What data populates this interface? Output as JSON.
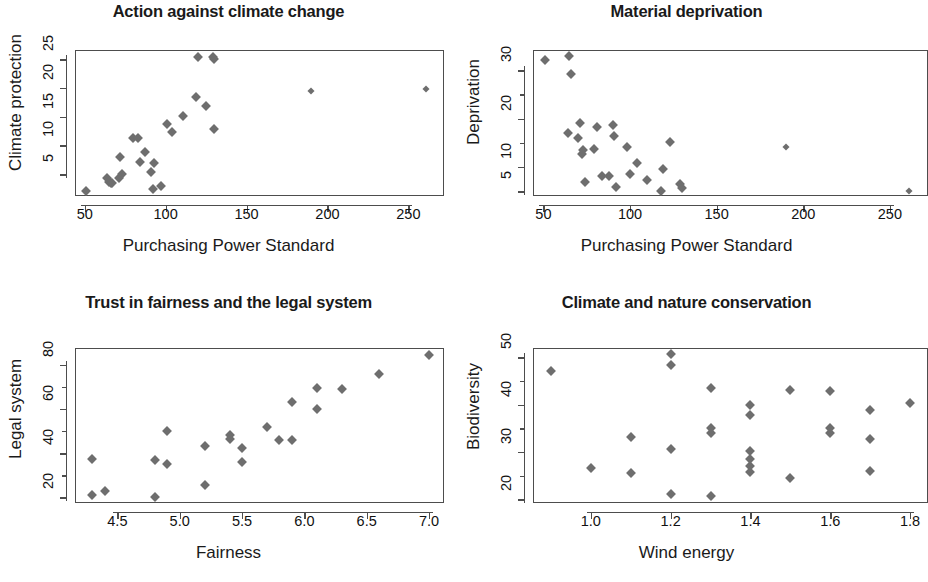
{
  "figure": {
    "layout": "2x2 grid of scatter plots",
    "background": "#ffffff",
    "marker_color": "#6e6e6e",
    "axis_color": "#4d4d4d"
  },
  "chart_data": [
    {
      "type": "scatter",
      "panel": "top-left",
      "title": "Action against climate change",
      "xlabel": "Purchasing Power Standard",
      "ylabel": "Climate protection",
      "xlim": [
        44,
        272
      ],
      "ylim": [
        1.2,
        26.6
      ],
      "xticks": [
        50,
        100,
        150,
        200,
        250
      ],
      "yticks": [
        5,
        10,
        15,
        20,
        25
      ],
      "grid": false,
      "legend": null,
      "points": [
        {
          "x": 51,
          "y": 2.1
        },
        {
          "x": 64,
          "y": 4.4
        },
        {
          "x": 65,
          "y": 3.6
        },
        {
          "x": 66,
          "y": 3.4
        },
        {
          "x": 67,
          "y": 3.5
        },
        {
          "x": 71,
          "y": 4.3
        },
        {
          "x": 72,
          "y": 7.9
        },
        {
          "x": 73,
          "y": 5.1
        },
        {
          "x": 80,
          "y": 11.3
        },
        {
          "x": 83,
          "y": 11.3
        },
        {
          "x": 84,
          "y": 7.1
        },
        {
          "x": 87,
          "y": 8.8
        },
        {
          "x": 91,
          "y": 5.4
        },
        {
          "x": 92,
          "y": 2.5
        },
        {
          "x": 93,
          "y": 7.0
        },
        {
          "x": 97,
          "y": 2.9
        },
        {
          "x": 101,
          "y": 13.7
        },
        {
          "x": 104,
          "y": 12.3
        },
        {
          "x": 111,
          "y": 15.1
        },
        {
          "x": 119,
          "y": 18.5
        },
        {
          "x": 120,
          "y": 25.4
        },
        {
          "x": 125,
          "y": 16.9
        },
        {
          "x": 129,
          "y": 25.3
        },
        {
          "x": 130,
          "y": 25.1
        },
        {
          "x": 130,
          "y": 12.8
        },
        {
          "x": 190,
          "y": 19.4
        },
        {
          "x": 261,
          "y": 19.8
        }
      ]
    },
    {
      "type": "scatter",
      "panel": "top-right",
      "title": "Material deprivation",
      "xlabel": "Purchasing Power Standard",
      "ylabel": "Deprivation",
      "xlim": [
        44,
        272
      ],
      "ylim": [
        4.0,
        34.2
      ],
      "xticks": [
        50,
        100,
        150,
        200,
        250
      ],
      "yticks": [
        5,
        10,
        20,
        30
      ],
      "yticks_minor": [
        15,
        25
      ],
      "grid": false,
      "legend": null,
      "points": [
        {
          "x": 51,
          "y": 32.2
        },
        {
          "x": 64,
          "y": 17.0
        },
        {
          "x": 65,
          "y": 33.0
        },
        {
          "x": 66,
          "y": 29.2
        },
        {
          "x": 70,
          "y": 16.0
        },
        {
          "x": 71,
          "y": 19.0
        },
        {
          "x": 72,
          "y": 12.6
        },
        {
          "x": 73,
          "y": 13.5
        },
        {
          "x": 74,
          "y": 6.8
        },
        {
          "x": 79,
          "y": 13.8
        },
        {
          "x": 81,
          "y": 18.2
        },
        {
          "x": 84,
          "y": 8.2
        },
        {
          "x": 88,
          "y": 8.2
        },
        {
          "x": 90,
          "y": 18.6
        },
        {
          "x": 91,
          "y": 16.4
        },
        {
          "x": 92,
          "y": 5.9
        },
        {
          "x": 98,
          "y": 14.1
        },
        {
          "x": 100,
          "y": 8.5
        },
        {
          "x": 104,
          "y": 10.8
        },
        {
          "x": 110,
          "y": 7.3
        },
        {
          "x": 118,
          "y": 5.0
        },
        {
          "x": 119,
          "y": 9.6
        },
        {
          "x": 123,
          "y": 15.2
        },
        {
          "x": 129,
          "y": 6.4
        },
        {
          "x": 130,
          "y": 5.6
        },
        {
          "x": 190,
          "y": 14.1
        },
        {
          "x": 261,
          "y": 5.1
        }
      ]
    },
    {
      "type": "scatter",
      "panel": "bottom-left",
      "title": "Trust in fairness and the legal system",
      "xlabel": "Fairness",
      "ylabel": "Legal system",
      "xlim": [
        4.16,
        7.12
      ],
      "ylim": [
        17.5,
        87.5
      ],
      "xticks": [
        4.5,
        5.0,
        5.5,
        6.0,
        6.5,
        7.0
      ],
      "xticklabels": [
        "4.5",
        "5.0",
        "5.5",
        "6.0",
        "6.5",
        "7.0"
      ],
      "yticks": [
        20,
        40,
        60,
        80
      ],
      "yticks_minor": [
        30,
        50,
        70
      ],
      "grid": false,
      "legend": null,
      "points": [
        {
          "x": 4.3,
          "y": 37.5
        },
        {
          "x": 4.3,
          "y": 21.2
        },
        {
          "x": 4.4,
          "y": 23.0
        },
        {
          "x": 4.8,
          "y": 37.0
        },
        {
          "x": 4.8,
          "y": 20.2
        },
        {
          "x": 4.9,
          "y": 50.0
        },
        {
          "x": 4.9,
          "y": 35.2
        },
        {
          "x": 5.2,
          "y": 43.1
        },
        {
          "x": 5.2,
          "y": 25.5
        },
        {
          "x": 5.4,
          "y": 48.0
        },
        {
          "x": 5.4,
          "y": 46.5
        },
        {
          "x": 5.5,
          "y": 42.3
        },
        {
          "x": 5.5,
          "y": 35.8
        },
        {
          "x": 5.7,
          "y": 51.8
        },
        {
          "x": 5.8,
          "y": 46.0
        },
        {
          "x": 5.9,
          "y": 63.3
        },
        {
          "x": 5.9,
          "y": 45.8
        },
        {
          "x": 6.1,
          "y": 69.6
        },
        {
          "x": 6.1,
          "y": 59.8
        },
        {
          "x": 6.3,
          "y": 69.0
        },
        {
          "x": 6.6,
          "y": 75.8
        },
        {
          "x": 7.0,
          "y": 84.3
        }
      ]
    },
    {
      "type": "scatter",
      "panel": "bottom-right",
      "title": "Climate and nature conservation",
      "xlabel": "Wind energy",
      "ylabel": "Biodiversity",
      "xlim": [
        0.855,
        1.845
      ],
      "ylim": [
        19.2,
        52.0
      ],
      "xticks": [
        1.0,
        1.2,
        1.4,
        1.6,
        1.8
      ],
      "xticklabels": [
        "1.0",
        "1.2",
        "1.4",
        "1.6",
        "1.8"
      ],
      "yticks": [
        20,
        30,
        40,
        50
      ],
      "yticks_minor": [
        25,
        35,
        45
      ],
      "grid": false,
      "legend": null,
      "points": [
        {
          "x": 0.9,
          "y": 47.2
        },
        {
          "x": 1.0,
          "y": 26.6
        },
        {
          "x": 1.1,
          "y": 33.2
        },
        {
          "x": 1.1,
          "y": 25.5
        },
        {
          "x": 1.2,
          "y": 50.8
        },
        {
          "x": 1.2,
          "y": 48.3
        },
        {
          "x": 1.2,
          "y": 30.6
        },
        {
          "x": 1.2,
          "y": 21.2
        },
        {
          "x": 1.3,
          "y": 43.5
        },
        {
          "x": 1.3,
          "y": 35.0
        },
        {
          "x": 1.3,
          "y": 34.0
        },
        {
          "x": 1.3,
          "y": 20.7
        },
        {
          "x": 1.4,
          "y": 40.0
        },
        {
          "x": 1.4,
          "y": 37.9
        },
        {
          "x": 1.4,
          "y": 30.2
        },
        {
          "x": 1.4,
          "y": 28.5
        },
        {
          "x": 1.4,
          "y": 27.0
        },
        {
          "x": 1.4,
          "y": 25.8
        },
        {
          "x": 1.5,
          "y": 43.2
        },
        {
          "x": 1.5,
          "y": 24.5
        },
        {
          "x": 1.6,
          "y": 43.0
        },
        {
          "x": 1.6,
          "y": 35.0
        },
        {
          "x": 1.6,
          "y": 34.0
        },
        {
          "x": 1.7,
          "y": 38.8
        },
        {
          "x": 1.7,
          "y": 32.8
        },
        {
          "x": 1.7,
          "y": 26.0
        },
        {
          "x": 1.8,
          "y": 40.3
        }
      ]
    }
  ]
}
